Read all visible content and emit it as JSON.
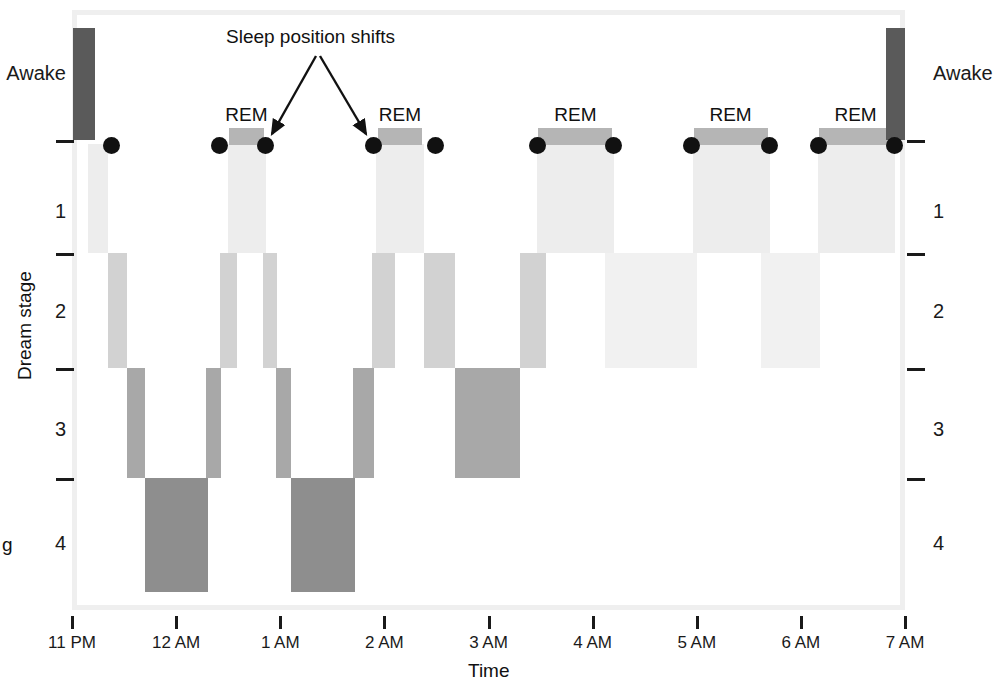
{
  "chart_data": {
    "type": "bar",
    "title": "",
    "annotation": "Sleep position shifts",
    "xlabel": "Time",
    "ylabel": "Dream stage",
    "x_tick_labels": [
      "11 PM",
      "12 AM",
      "1 AM",
      "2 AM",
      "3 AM",
      "4 AM",
      "5 AM",
      "6 AM",
      "7 AM"
    ],
    "x_tick_hours": [
      0,
      1,
      2,
      3,
      4,
      5,
      6,
      7,
      8
    ],
    "xlim_hours": [
      0,
      8
    ],
    "y_categories": [
      "Awake",
      "REM",
      "1",
      "2",
      "3",
      "4"
    ],
    "y_tick_labels_left": [
      "Awake",
      "1",
      "2",
      "3",
      "4"
    ],
    "y_tick_labels_right": [
      "Awake",
      "1",
      "2",
      "3",
      "4"
    ],
    "grid": false,
    "legend": "none",
    "rem_labels": [
      "REM",
      "REM",
      "REM",
      "REM",
      "REM"
    ],
    "colors": {
      "awake": "#5a5a5a",
      "rem": "#b5b5b5",
      "stage1": "#ededed",
      "stage2": "#d2d2d2",
      "stage2_light": "#f1f1f1",
      "stage3": "#a8a8a8",
      "stage4": "#8e8e8e",
      "marker": "#111111",
      "frame": "#efefef",
      "axis": "#1a1a1a"
    },
    "segments": [
      {
        "stage": "Awake",
        "start_hour": 0.01,
        "end_hour": 0.22,
        "level": "awake",
        "color": "#5a5a5a"
      },
      {
        "stage": "1",
        "start_hour": 0.155,
        "end_hour": 0.35,
        "level": "stage1",
        "color": "#ededed"
      },
      {
        "stage": "2",
        "start_hour": 0.35,
        "end_hour": 0.525,
        "level": "stage2",
        "color": "#d2d2d2"
      },
      {
        "stage": "3",
        "start_hour": 0.525,
        "end_hour": 0.7,
        "level": "stage3",
        "color": "#a8a8a8"
      },
      {
        "stage": "4",
        "start_hour": 0.7,
        "end_hour": 1.31,
        "level": "stage4",
        "color": "#8e8e8e"
      },
      {
        "stage": "3",
        "start_hour": 1.29,
        "end_hour": 1.43,
        "level": "stage3",
        "color": "#a8a8a8"
      },
      {
        "stage": "2",
        "start_hour": 1.42,
        "end_hour": 1.58,
        "level": "stage2",
        "color": "#d2d2d2"
      },
      {
        "stage": "1",
        "start_hour": 1.5,
        "end_hour": 1.86,
        "level": "stage1",
        "color": "#ededed"
      },
      {
        "stage": "REM",
        "start_hour": 1.51,
        "end_hour": 1.84,
        "level": "rem",
        "color": "#b5b5b5"
      },
      {
        "stage": "2",
        "start_hour": 1.83,
        "end_hour": 1.97,
        "level": "stage2",
        "color": "#d2d2d2"
      },
      {
        "stage": "3",
        "start_hour": 1.96,
        "end_hour": 2.1,
        "level": "stage3",
        "color": "#a8a8a8"
      },
      {
        "stage": "4",
        "start_hour": 2.1,
        "end_hour": 2.72,
        "level": "stage4",
        "color": "#8e8e8e"
      },
      {
        "stage": "3",
        "start_hour": 2.7,
        "end_hour": 2.9,
        "level": "stage3",
        "color": "#a8a8a8"
      },
      {
        "stage": "2",
        "start_hour": 2.88,
        "end_hour": 3.1,
        "level": "stage2",
        "color": "#d2d2d2"
      },
      {
        "stage": "1",
        "start_hour": 2.92,
        "end_hour": 3.38,
        "level": "stage1",
        "color": "#ededed"
      },
      {
        "stage": "REM",
        "start_hour": 2.94,
        "end_hour": 3.36,
        "level": "rem",
        "color": "#b5b5b5"
      },
      {
        "stage": "2",
        "start_hour": 3.38,
        "end_hour": 3.68,
        "level": "stage2",
        "color": "#d2d2d2"
      },
      {
        "stage": "3",
        "start_hour": 3.68,
        "end_hour": 4.3,
        "level": "stage3",
        "color": "#a8a8a8"
      },
      {
        "stage": "2",
        "start_hour": 4.3,
        "end_hour": 4.55,
        "level": "stage2",
        "color": "#d2d2d2"
      },
      {
        "stage": "1",
        "start_hour": 4.47,
        "end_hour": 5.21,
        "level": "stage1",
        "color": "#ededed"
      },
      {
        "stage": "REM",
        "start_hour": 4.48,
        "end_hour": 5.19,
        "level": "rem",
        "color": "#b5b5b5"
      },
      {
        "stage": "2",
        "start_hour": 5.12,
        "end_hour": 6.0,
        "level": "stage2_light",
        "color": "#f1f1f1"
      },
      {
        "stage": "1",
        "start_hour": 5.96,
        "end_hour": 6.7,
        "level": "stage1",
        "color": "#ededed"
      },
      {
        "stage": "REM",
        "start_hour": 5.97,
        "end_hour": 6.68,
        "level": "rem",
        "color": "#b5b5b5"
      },
      {
        "stage": "2",
        "start_hour": 6.62,
        "end_hour": 7.18,
        "level": "stage2_light",
        "color": "#f1f1f1"
      },
      {
        "stage": "1",
        "start_hour": 7.16,
        "end_hour": 7.9,
        "level": "stage1",
        "color": "#ededed"
      },
      {
        "stage": "REM",
        "start_hour": 7.17,
        "end_hour": 7.88,
        "level": "rem",
        "color": "#b5b5b5"
      },
      {
        "stage": "Awake",
        "start_hour": 7.82,
        "end_hour": 8.0,
        "level": "awake",
        "color": "#5a5a5a"
      }
    ],
    "position_shift_markers_hours": [
      0.375,
      1.415,
      1.855,
      2.895,
      3.49,
      4.47,
      5.2,
      5.95,
      6.7,
      7.17,
      7.9
    ]
  }
}
